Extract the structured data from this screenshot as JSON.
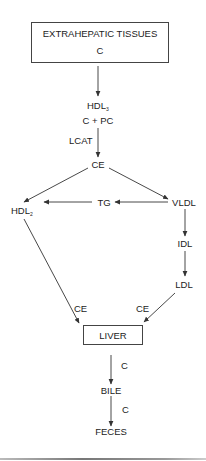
{
  "diagram": {
    "title_box": {
      "line1": "EXTRAHEPATIC TISSUES",
      "line2": "C"
    },
    "nodes": {
      "hdl3": {
        "base": "HDL",
        "sub": "3"
      },
      "c_pc": "C + PC",
      "lcat": "LCAT",
      "ce_top": "CE",
      "hdl2": {
        "base": "HDL",
        "sub": "2"
      },
      "tg": "TG",
      "vldl": "VLDL",
      "idl": "IDL",
      "ldl": "LDL",
      "ce_left": "CE",
      "ce_right": "CE",
      "liver": "LIVER",
      "c_upper": "C",
      "bile": "BILE",
      "c_lower": "C",
      "feces": "FECES"
    },
    "edges": [
      {
        "from": "EXTRAHEPATIC TISSUES",
        "to": "HDL3"
      },
      {
        "from": "C + PC",
        "to": "CE",
        "label": "LCAT"
      },
      {
        "from": "CE",
        "to": "HDL2"
      },
      {
        "from": "CE",
        "to": "VLDL"
      },
      {
        "from": "VLDL",
        "to": "TG"
      },
      {
        "from": "TG",
        "to": "HDL2"
      },
      {
        "from": "VLDL",
        "to": "IDL"
      },
      {
        "from": "IDL",
        "to": "LDL"
      },
      {
        "from": "HDL2",
        "to": "LIVER",
        "label": "CE"
      },
      {
        "from": "LDL",
        "to": "LIVER",
        "label": "CE"
      },
      {
        "from": "LIVER",
        "to": "BILE",
        "label": "C"
      },
      {
        "from": "BILE",
        "to": "FECES",
        "label": "C"
      }
    ]
  }
}
